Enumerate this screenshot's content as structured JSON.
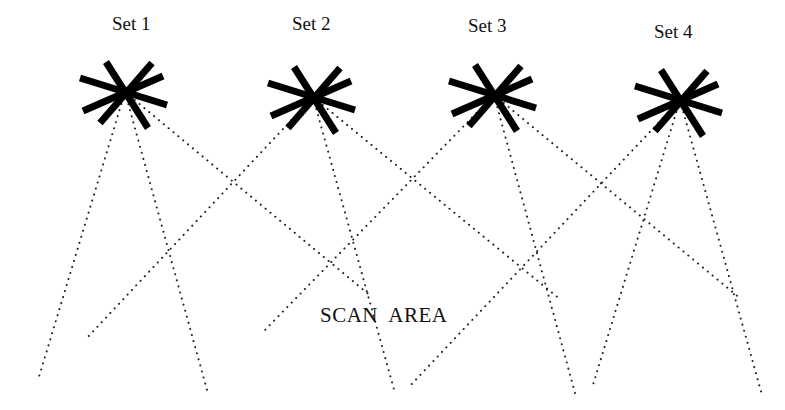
{
  "diagram": {
    "title": "",
    "scan_area_label": "SCAN  AREA",
    "scan_area_position": {
      "x": 320,
      "y": 322
    },
    "colors": {
      "background": "#ffffff",
      "ink": "#000000",
      "beam": "#222222"
    },
    "sets": [
      {
        "label": "Set 1",
        "label_pos": {
          "x": 112,
          "y": 30
        },
        "center": {
          "x": 125,
          "y": 92
        },
        "beams": [
          {
            "x": 38,
            "y": 380
          },
          {
            "x": 207,
            "y": 390
          },
          {
            "x": 372,
            "y": 297
          }
        ]
      },
      {
        "label": "Set 2",
        "label_pos": {
          "x": 292,
          "y": 30
        },
        "center": {
          "x": 313,
          "y": 97
        },
        "beams": [
          {
            "x": 85,
            "y": 340
          },
          {
            "x": 395,
            "y": 393
          },
          {
            "x": 561,
            "y": 300
          }
        ]
      },
      {
        "label": "Set 3",
        "label_pos": {
          "x": 468,
          "y": 32
        },
        "center": {
          "x": 494,
          "y": 95
        },
        "beams": [
          {
            "x": 265,
            "y": 330
          },
          {
            "x": 575,
            "y": 393
          },
          {
            "x": 741,
            "y": 299
          }
        ]
      },
      {
        "label": "Set 4",
        "label_pos": {
          "x": 654,
          "y": 38
        },
        "center": {
          "x": 680,
          "y": 100
        },
        "beams": [
          {
            "x": 408,
            "y": 388
          },
          {
            "x": 592,
            "y": 388
          },
          {
            "x": 762,
            "y": 395
          }
        ]
      }
    ],
    "star_arms": [
      {
        "dx1": -19,
        "dy1": -30,
        "dx2": 23,
        "dy2": 36
      },
      {
        "dx1": 27,
        "dy1": -29,
        "dx2": -25,
        "dy2": 31
      },
      {
        "dx1": -45,
        "dy1": -14,
        "dx2": 42,
        "dy2": 13
      },
      {
        "dx1": 38,
        "dy1": -16,
        "dx2": -42,
        "dy2": 19
      }
    ],
    "icon": "asterisk-light-source-icon"
  }
}
